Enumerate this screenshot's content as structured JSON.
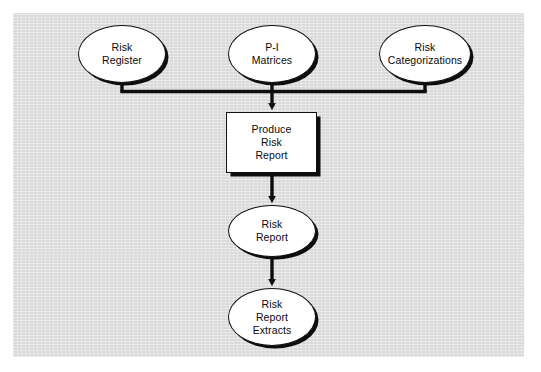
{
  "diagram": {
    "background_color": "#dedede",
    "page_color": "#ffffff",
    "shape_fill": "#ffffff",
    "stroke_color": "#101010",
    "shadow_color": "#0d0d0d",
    "nodes": [
      {
        "id": "risk-register",
        "label": "Risk\nRegister",
        "shape": "ellipse",
        "x": 78,
        "y": 25,
        "w": 88,
        "h": 58
      },
      {
        "id": "pi-matrices",
        "label": "P-I\nMatrices",
        "shape": "ellipse",
        "x": 228,
        "y": 25,
        "w": 88,
        "h": 58
      },
      {
        "id": "risk-categorizations",
        "label": "Risk\nCategorizations",
        "shape": "ellipse",
        "x": 379,
        "y": 25,
        "w": 92,
        "h": 58
      },
      {
        "id": "produce-risk-report",
        "label": "Produce\nRisk\nReport",
        "shape": "rect",
        "x": 226,
        "y": 112,
        "w": 91,
        "h": 61
      },
      {
        "id": "risk-report",
        "label": "Risk\nReport",
        "shape": "ellipse",
        "x": 228,
        "y": 205,
        "w": 88,
        "h": 52
      },
      {
        "id": "risk-report-extracts",
        "label": "Risk\nReport\nExtracts",
        "shape": "ellipse",
        "x": 228,
        "y": 288,
        "w": 88,
        "h": 58
      }
    ],
    "connectors": [
      {
        "id": "risk-register-to-bus",
        "from": "risk-register",
        "to": "bus",
        "type": "orthogonal"
      },
      {
        "id": "pi-matrices-to-bus",
        "from": "pi-matrices",
        "to": "bus",
        "type": "vertical"
      },
      {
        "id": "risk-categorizations-to-bus",
        "from": "risk-categorizations",
        "to": "bus",
        "type": "orthogonal"
      },
      {
        "id": "bus-to-produce-risk-report",
        "from": "bus",
        "to": "produce-risk-report",
        "type": "arrow-down"
      },
      {
        "id": "produce-to-risk-report",
        "from": "produce-risk-report",
        "to": "risk-report",
        "type": "arrow-down"
      },
      {
        "id": "risk-report-to-extracts",
        "from": "risk-report",
        "to": "risk-report-extracts",
        "type": "arrow-down"
      }
    ]
  }
}
